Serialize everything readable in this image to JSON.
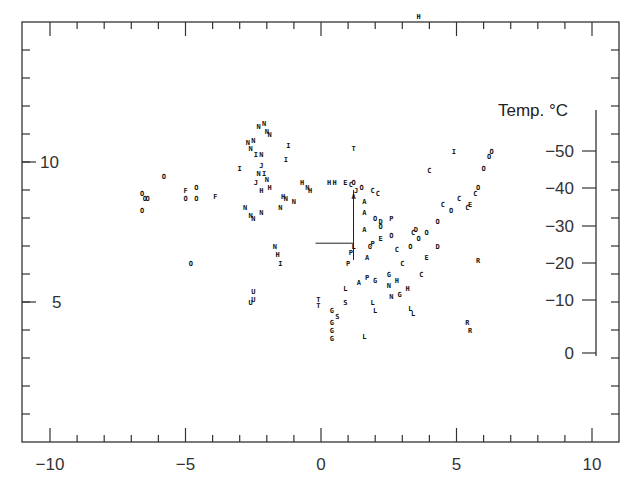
{
  "chart_data": {
    "type": "scatter",
    "title": "",
    "xlabel": "",
    "ylabel": "",
    "xlim": [
      -11,
      10.3
    ],
    "ylim": [
      0,
      15
    ],
    "grid": false,
    "legend": "none",
    "x_ticks": {
      "major": [
        -10,
        -5,
        0,
        5,
        10
      ],
      "labels": [
        "−10",
        "−5",
        "0",
        "5",
        "10"
      ]
    },
    "y_ticks": {
      "major": [
        5,
        10
      ],
      "labels": [
        "5",
        "10"
      ]
    },
    "inset_axis": {
      "title": "Temp. °C",
      "ticks": [
        -50,
        -40,
        -30,
        -20,
        -10,
        0
      ],
      "labels": [
        "−50",
        "−40",
        "−30",
        "−20",
        "−10",
        "0"
      ]
    },
    "marker_style": "letters",
    "annotation_line": {
      "x": [
        -0.2,
        1.2
      ],
      "y": [
        7.1,
        7.1
      ]
    },
    "series": [
      {
        "name": "O",
        "points": [
          [
            -6.6,
            8.9
          ],
          [
            -6.5,
            8.7
          ],
          [
            -6.4,
            8.7
          ],
          [
            -5.8,
            9.5
          ],
          [
            -4.6,
            9.1
          ],
          [
            -4.6,
            8.7
          ],
          [
            -6.6,
            8.3
          ],
          [
            -5.0,
            8.7
          ],
          [
            -4.8,
            6.4
          ],
          [
            1.2,
            9.3
          ],
          [
            1.5,
            9.1
          ],
          [
            2.0,
            8.0
          ],
          [
            2.2,
            7.7
          ],
          [
            2.6,
            7.4
          ],
          [
            3.3,
            7.0
          ],
          [
            3.6,
            7.3
          ],
          [
            3.9,
            7.5
          ],
          [
            4.3,
            7.9
          ],
          [
            4.8,
            8.3
          ],
          [
            5.8,
            9.1
          ],
          [
            6.0,
            9.8
          ],
          [
            6.2,
            10.2
          ],
          [
            6.3,
            10.4
          ]
        ]
      },
      {
        "name": "N",
        "points": [
          [
            -2.7,
            10.7
          ],
          [
            -2.5,
            10.8
          ],
          [
            -2.3,
            11.3
          ],
          [
            -2.1,
            11.4
          ],
          [
            -2.0,
            11.1
          ],
          [
            -1.9,
            11.0
          ],
          [
            -2.6,
            10.5
          ],
          [
            -2.2,
            10.3
          ],
          [
            -2.8,
            8.4
          ],
          [
            -2.6,
            8.1
          ],
          [
            -2.5,
            8.0
          ],
          [
            -2.2,
            8.2
          ],
          [
            -1.5,
            8.4
          ],
          [
            -1.3,
            8.7
          ],
          [
            -1.0,
            8.6
          ],
          [
            -0.5,
            9.1
          ],
          [
            -2.3,
            9.6
          ],
          [
            -2.0,
            9.4
          ],
          [
            -1.7,
            7.0
          ],
          [
            2.5,
            5.6
          ],
          [
            2.6,
            5.2
          ]
        ]
      },
      {
        "name": "H",
        "points": [
          [
            -2.2,
            9.0
          ],
          [
            -1.9,
            9.1
          ],
          [
            -1.4,
            8.8
          ],
          [
            -0.7,
            9.3
          ],
          [
            -0.4,
            9.0
          ],
          [
            0.3,
            9.3
          ],
          [
            0.5,
            9.3
          ],
          [
            3.6,
            15.2
          ],
          [
            -1.6,
            6.7
          ],
          [
            2.8,
            5.8
          ],
          [
            3.2,
            5.5
          ]
        ]
      },
      {
        "name": "I",
        "points": [
          [
            -3.0,
            9.8
          ],
          [
            -2.4,
            10.3
          ],
          [
            -2.1,
            9.6
          ],
          [
            -1.2,
            10.6
          ],
          [
            -1.3,
            10.1
          ],
          [
            -1.5,
            6.4
          ],
          [
            4.9,
            10.4
          ]
        ]
      },
      {
        "name": "C",
        "points": [
          [
            1.1,
            9.2
          ],
          [
            1.9,
            9.0
          ],
          [
            2.1,
            8.9
          ],
          [
            4.0,
            9.7
          ],
          [
            3.4,
            7.5
          ],
          [
            3.0,
            6.4
          ],
          [
            2.8,
            6.9
          ],
          [
            3.7,
            6.0
          ],
          [
            4.5,
            8.5
          ],
          [
            5.1,
            8.7
          ],
          [
            5.4,
            8.4
          ],
          [
            5.7,
            8.9
          ]
        ]
      },
      {
        "name": "E",
        "points": [
          [
            0.9,
            9.3
          ],
          [
            2.2,
            7.3
          ],
          [
            3.9,
            6.6
          ],
          [
            5.5,
            8.5
          ]
        ]
      },
      {
        "name": "A",
        "points": [
          [
            1.2,
            8.8
          ],
          [
            1.6,
            8.6
          ],
          [
            1.6,
            8.2
          ],
          [
            1.6,
            7.6
          ],
          [
            1.7,
            6.6
          ],
          [
            1.4,
            5.7
          ]
        ]
      },
      {
        "name": "P",
        "points": [
          [
            1.1,
            6.8
          ],
          [
            1.0,
            6.4
          ],
          [
            1.9,
            7.1
          ],
          [
            1.7,
            5.9
          ],
          [
            2.6,
            8.0
          ]
        ]
      },
      {
        "name": "L",
        "points": [
          [
            0.9,
            5.5
          ],
          [
            1.9,
            5.0
          ],
          [
            2.0,
            4.7
          ],
          [
            3.3,
            4.8
          ],
          [
            3.4,
            4.6
          ],
          [
            1.6,
            3.8
          ],
          [
            1.2,
            7.0
          ]
        ]
      },
      {
        "name": "G",
        "points": [
          [
            1.8,
            7.0
          ],
          [
            2.0,
            5.8
          ],
          [
            0.4,
            4.7
          ],
          [
            0.4,
            4.3
          ],
          [
            0.4,
            4.0
          ],
          [
            0.4,
            3.7
          ],
          [
            2.5,
            6.0
          ],
          [
            2.9,
            5.3
          ]
        ]
      },
      {
        "name": "D",
        "points": [
          [
            2.2,
            7.9
          ],
          [
            4.3,
            7.0
          ],
          [
            3.5,
            7.6
          ]
        ]
      },
      {
        "name": "T",
        "points": [
          [
            1.2,
            10.5
          ],
          [
            -0.1,
            5.1
          ],
          [
            -0.1,
            4.9
          ]
        ]
      },
      {
        "name": "U",
        "points": [
          [
            -2.5,
            5.4
          ],
          [
            -2.5,
            5.1
          ],
          [
            -2.6,
            5.0
          ]
        ]
      },
      {
        "name": "R",
        "points": [
          [
            5.8,
            6.5
          ],
          [
            5.4,
            4.3
          ],
          [
            5.5,
            4.0
          ]
        ]
      },
      {
        "name": "S",
        "points": [
          [
            0.9,
            5.0
          ],
          [
            0.6,
            4.5
          ]
        ]
      },
      {
        "name": "J",
        "points": [
          [
            -2.2,
            9.9
          ],
          [
            -2.4,
            9.3
          ],
          [
            1.3,
            9.0
          ]
        ]
      },
      {
        "name": "F",
        "points": [
          [
            -5.0,
            9.0
          ],
          [
            -3.9,
            8.8
          ]
        ]
      }
    ]
  }
}
